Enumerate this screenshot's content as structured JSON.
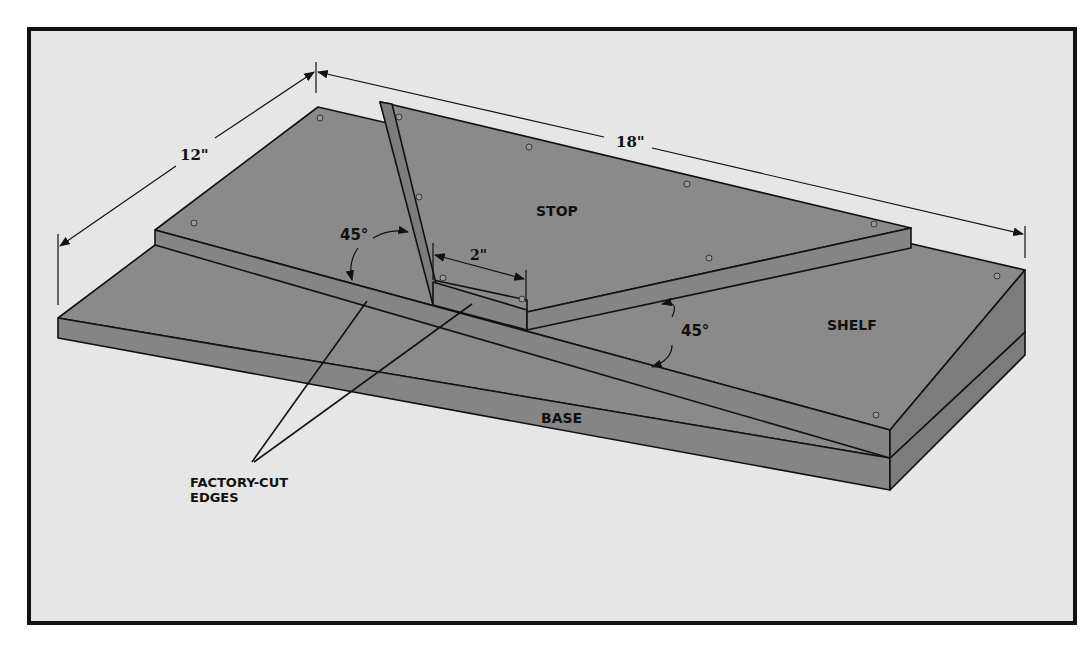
{
  "figure": {
    "type": "isometric jig drawing",
    "colors": {
      "background": "#e6e6e6",
      "board": "#8a8a8a",
      "outline": "#111111",
      "frame": "#111111"
    }
  },
  "labels": {
    "stop": "STOP",
    "shelf": "SHELF",
    "base": "BASE",
    "factory_cut_line1": "FACTORY-CUT",
    "factory_cut_line2": "EDGES"
  },
  "dimensions": {
    "width": "12\"",
    "length": "18\"",
    "offset": "2\"",
    "angle_left": "45°",
    "angle_right": "45°"
  }
}
